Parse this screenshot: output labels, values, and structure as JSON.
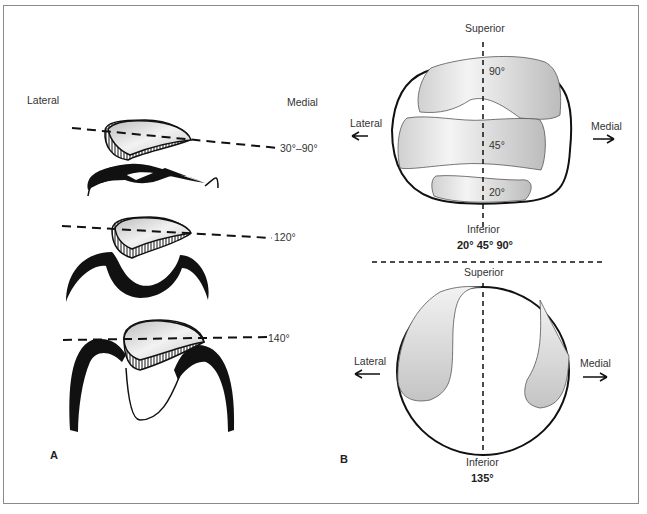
{
  "panel_a": {
    "letter": "A",
    "lateral_label": "Lateral",
    "medial_label": "Medial",
    "angles": [
      "30°–90°",
      "120°",
      "140°"
    ]
  },
  "panel_b": {
    "letter": "B",
    "top": {
      "superior_label": "Superior",
      "inferior_label": "Inferior",
      "lateral_label": "Lateral",
      "medial_label": "Medial",
      "zones": [
        "90°",
        "45°",
        "20°"
      ],
      "caption": "20° 45° 90°"
    },
    "bottom": {
      "superior_label": "Superior",
      "inferior_label": "Inferior",
      "lateral_label": "Lateral",
      "medial_label": "Medial",
      "caption": "135°"
    }
  },
  "colors": {
    "fill_gray": "#cfcfcf",
    "stroke": "#111111",
    "frame": "#8a8a8a"
  }
}
